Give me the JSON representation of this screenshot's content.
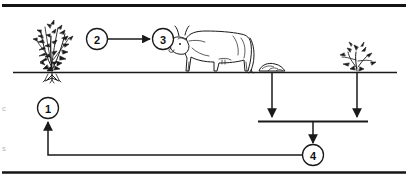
{
  "figure": {
    "caption": "",
    "background_color": "#ffffff",
    "ink_color": "#1a1a1a"
  },
  "frame": {
    "top_rule": "top-border-rule",
    "bottom_rule": "bottom-border-rule"
  },
  "ground": {
    "label": "soil-surface-line"
  },
  "nodes": [
    {
      "id": "1",
      "number": "1",
      "name": "node-1",
      "cx": 48,
      "cy": 108
    },
    {
      "id": "2",
      "number": "2",
      "name": "node-2",
      "cx": 97,
      "cy": 39
    },
    {
      "id": "3",
      "number": "3",
      "name": "node-3",
      "cx": 163,
      "cy": 39
    },
    {
      "id": "4",
      "number": "4",
      "name": "node-4",
      "cx": 313,
      "cy": 155
    }
  ],
  "objects": {
    "plant": "leafy-plant-with-roots",
    "plant_roots": "plant-root-tuft",
    "cow": "cow-livestock",
    "dung": "manure-dung-pile",
    "shrub": "small-shrub-tuft"
  },
  "arrows": {
    "plant_to_cow": "arrow-plant-to-cow",
    "dung_down": "arrow-dung-to-soil",
    "shrub_down": "arrow-shrub-to-soil",
    "pool_down": "arrow-soil-pool-to-node-4",
    "return_up": "arrow-return-to-node-1",
    "return_line": "line-node-4-to-node-1"
  },
  "soil_pool": {
    "label": "soil-nutrient-pool-line"
  },
  "margin_marks": [
    {
      "text": "c",
      "x": 2,
      "y": 108
    },
    {
      "text": "s",
      "x": 2,
      "y": 148
    }
  ]
}
